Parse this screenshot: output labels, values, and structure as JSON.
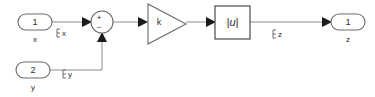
{
  "diagram": {
    "background_color": "#ffffff",
    "wire_color": "#8c8c8c",
    "block_color": "#6b6b6b",
    "text_color": "#2b2b2b",
    "width": 375,
    "height": 97
  },
  "inports": [
    {
      "number": "1",
      "name": "x",
      "signal_label": "x"
    },
    {
      "number": "2",
      "name": "y",
      "signal_label": "y"
    }
  ],
  "sum_block": {
    "name": "sum",
    "shape": "circle",
    "sign_top": "+",
    "sign_bottom": "–"
  },
  "gain_block": {
    "name": "gain",
    "shape": "triangle",
    "label": "k"
  },
  "abs_block": {
    "name": "abs",
    "shape": "square",
    "label": "|u|"
  },
  "outports": [
    {
      "number": "1",
      "name": "z",
      "signal_label": "z"
    }
  ]
}
